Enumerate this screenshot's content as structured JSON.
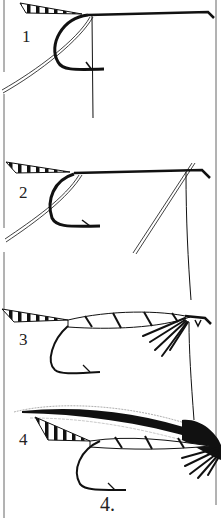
{
  "figure": {
    "caption": "4.",
    "steps": [
      {
        "label": "1",
        "x": 22,
        "y": 28
      },
      {
        "label": "2",
        "x": 19,
        "y": 184
      },
      {
        "label": "3",
        "x": 19,
        "y": 331
      },
      {
        "label": "4",
        "x": 19,
        "y": 431
      }
    ]
  },
  "colors": {
    "ink": "#111111",
    "frame": "#555555",
    "paper": "#ffffff"
  }
}
